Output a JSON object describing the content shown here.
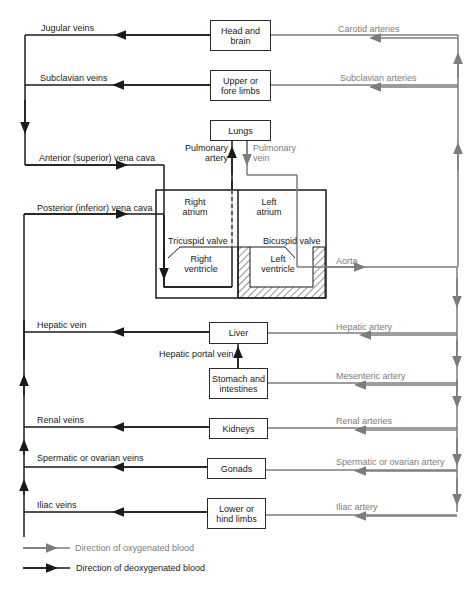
{
  "organs": {
    "head": "Head and brain",
    "upper_limbs": "Upper or fore limbs",
    "lungs": "Lungs",
    "liver": "Liver",
    "stomach": "Stomach and intestines",
    "kidneys": "Kidneys",
    "gonads": "Gonads",
    "lower_limbs": "Lower or hind limbs"
  },
  "heart": {
    "right_atrium": "Right atrium",
    "left_atrium": "Left atrium",
    "right_ventricle": "Right ventricle",
    "left_ventricle": "Left ventricle",
    "tricuspid": "Tricuspid valve",
    "bicuspid": "Bicuspid valve"
  },
  "veins": {
    "jugular": "Jugular veins",
    "subclavian": "Subclavian veins",
    "anterior_vc": "Anterior (superior) vena cava",
    "posterior_vc": "Posterior (inferior) vena cava",
    "pulmonary_artery": "Pulmonary artery",
    "hepatic": "Hepatic vein",
    "hepatic_portal": "Hepatic portal vein",
    "renal": "Renal veins",
    "spermatic": "Spermatic or ovarian veins",
    "iliac": "Iliac veins"
  },
  "arteries": {
    "carotid": "Carotid arteries",
    "subclavian": "Subclavian arteries",
    "pulmonary_vein": "Pulmonary vein",
    "aorta": "Aorta",
    "hepatic": "Hepatic artery",
    "mesenteric": "Mesenteric artery",
    "renal": "Renal arteries",
    "spermatic": "Spermatic or ovarian artery",
    "iliac": "Iliac artery"
  },
  "legend": {
    "oxygenated": "Direction of oxygenated blood",
    "deoxygenated": "Direction of deoxygenated blood"
  },
  "colors": {
    "oxygenated": "#7c7c7c",
    "deoxygenated": "#1a1a1a"
  }
}
